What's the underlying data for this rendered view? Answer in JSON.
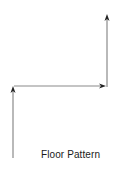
{
  "diagram": {
    "title": "Floor Pattern",
    "stroke_color": "#8a8a8a",
    "arrowhead_color": "#222222",
    "segments": [
      {
        "id": "left-vertical",
        "from": [
          13,
          158
        ],
        "to": [
          13,
          88
        ],
        "direction": "up"
      },
      {
        "id": "horizontal",
        "from": [
          14,
          86
        ],
        "to": [
          105,
          86
        ],
        "direction": "right"
      },
      {
        "id": "right-vertical",
        "from": [
          107,
          86
        ],
        "to": [
          107,
          15
        ],
        "direction": "up"
      }
    ]
  }
}
